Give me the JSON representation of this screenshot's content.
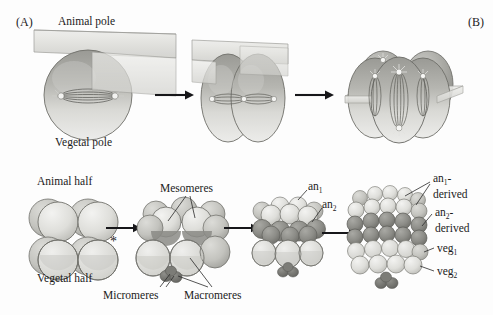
{
  "figure": {
    "panel_a_tag": "(A)",
    "panel_b_tag": "(B)",
    "background_color": "#fdfdfd",
    "ink_color": "#1b1b1b"
  },
  "top_row": {
    "labels": {
      "animal_pole": "Animal pole",
      "vegetal_pole": "Vegetal pole"
    },
    "stages": [
      {
        "name": "one-cell-zygote",
        "cells": 1,
        "plane": "meridional-vertical",
        "spindle": "horizontal"
      },
      {
        "name": "two-cell-stage",
        "cells": 2,
        "plane": "meridional-vertical",
        "spindle": "horizontal"
      },
      {
        "name": "four-cell-stage",
        "cells": 4,
        "plane": "equatorial-horizontal",
        "spindle": "vertical"
      }
    ],
    "arrows": 2
  },
  "bottom_row": {
    "labels": {
      "animal_half": "Animal half",
      "vegetal_half": "Vegetal half",
      "mesomeres": "Mesomeres",
      "micromeres": "Micromeres",
      "macromeres": "Macromeres",
      "an1": "an",
      "an1_sub": "1",
      "an2": "an",
      "an2_sub": "2",
      "an1_derived_line1": "an",
      "an1_derived_sub": "1",
      "an1_derived_dash": "-",
      "an1_derived_line2": "derived",
      "an2_derived_line1": "an",
      "an2_derived_sub": "2",
      "an2_derived_dash": "-",
      "an2_derived_line2": "derived",
      "veg1": "veg",
      "veg1_sub": "1",
      "veg2": "veg",
      "veg2_sub": "2"
    },
    "asterisk": "*",
    "stages": [
      {
        "name": "eight-cell-stage",
        "cells": 8,
        "tiers": [
          "animal half",
          "vegetal half"
        ]
      },
      {
        "name": "sixteen-cell-stage",
        "cells": 16,
        "tiers": [
          "mesomeres",
          "macromeres",
          "micromeres"
        ]
      },
      {
        "name": "thirty-two-cell-stage",
        "cells": 32,
        "tiers": [
          "an1",
          "an2",
          "veg",
          "micromeres"
        ]
      },
      {
        "name": "sixty-cell-stage",
        "cells": 60,
        "tiers": [
          "an1-derived",
          "an2-derived",
          "veg1",
          "veg2",
          "micromeres"
        ]
      }
    ],
    "arrows": 3
  },
  "colors": {
    "cell_light": "#e3e3e0",
    "cell_mid": "#c2c2bd",
    "cell_dark": "#8f8f8a",
    "cell_darker": "#6f6f6b",
    "plane_fill": "#dcdcd8",
    "outline": "#5a5a56",
    "micromere": "#72726d"
  }
}
